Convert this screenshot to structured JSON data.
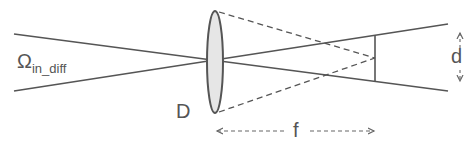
{
  "diagram": {
    "labels": {
      "omega_main": "Ω",
      "omega_sub": "in_diff",
      "lens_diameter": "D",
      "focal_length": "f",
      "spot_size": "d"
    },
    "colors": {
      "line": "#555555",
      "lens_fill": "#e6e6e6",
      "background": "#ffffff"
    }
  }
}
